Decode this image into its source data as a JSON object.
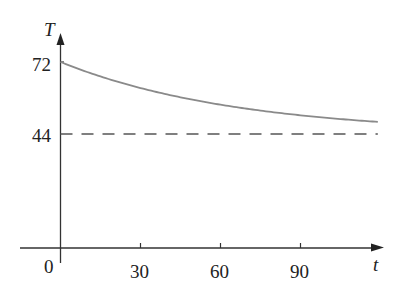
{
  "chart_data": {
    "type": "line",
    "title": "",
    "xlabel": "t",
    "ylabel": "T",
    "x_ticks": [
      0,
      30,
      60,
      90
    ],
    "y_ticks": [
      44,
      72
    ],
    "xlim": [
      0,
      120
    ],
    "ylim": [
      0,
      77
    ],
    "grid": false,
    "legend": null,
    "series": [
      {
        "name": "T(t) = 44 + 28e^(-0.015t)",
        "style": "solid",
        "color": "#8a8a8a",
        "x": [
          0,
          10,
          20,
          30,
          40,
          50,
          60,
          70,
          80,
          90,
          100,
          110,
          119
        ],
        "y": [
          72.0,
          68.1,
          64.7,
          61.9,
          59.4,
          57.2,
          55.4,
          53.8,
          52.4,
          51.2,
          50.2,
          49.4,
          48.7
        ]
      },
      {
        "name": "asymptote T = 44",
        "style": "dashed",
        "color": "#555555",
        "x": [
          0,
          119
        ],
        "y": [
          44,
          44
        ]
      }
    ]
  },
  "labels": {
    "y_axis": "T",
    "x_axis": "t",
    "origin": "0",
    "y72": "72",
    "y44": "44",
    "x30": "30",
    "x60": "60",
    "x90": "90"
  }
}
